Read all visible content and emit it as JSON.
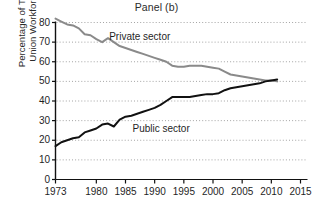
{
  "chart_data": {
    "type": "line",
    "title": "Panel (b)",
    "xlabel": "",
    "ylabel": "Percentage of Total Union Workforce",
    "ylabel_lines": [
      "Percentage of Total",
      "Union Workforce"
    ],
    "xlim": [
      1973,
      2015
    ],
    "ylim": [
      0,
      80
    ],
    "grid": true,
    "grid_axis": "y",
    "legend": "inline-annotations",
    "xticks": [
      1973,
      1980,
      1985,
      1990,
      1995,
      2000,
      2005,
      2010,
      2015
    ],
    "xtick_labels": [
      "1973",
      "1980",
      "1985",
      "1990",
      "1995",
      "2000",
      "2005",
      "2010",
      "2015"
    ],
    "yticks": [
      0,
      10,
      20,
      30,
      40,
      50,
      60,
      70,
      80
    ],
    "ytick_labels": [
      "0",
      "10",
      "20",
      "30",
      "40",
      "50",
      "60",
      "70",
      "80"
    ],
    "series": [
      {
        "name": "Private sector",
        "color": "#8a8a8a",
        "label_x": 1982.2,
        "label_y": 72.5,
        "x": [
          1973,
          1974,
          1975,
          1976,
          1977,
          1978,
          1979,
          1980,
          1981,
          1982,
          1983,
          1984,
          1985,
          1986,
          1987,
          1988,
          1989,
          1990,
          1991,
          1992,
          1993,
          1994,
          1995,
          1996,
          1997,
          1998,
          1999,
          2000,
          2001,
          2002,
          2003,
          2004,
          2005,
          2006,
          2007,
          2008,
          2009,
          2010,
          2011
        ],
        "values": [
          82,
          80.5,
          79,
          78.5,
          77,
          74,
          73.5,
          71.5,
          70,
          72,
          70,
          68,
          67,
          66,
          65,
          64,
          63,
          62,
          61,
          60,
          58,
          57.5,
          57.5,
          58,
          58,
          58,
          57.5,
          57,
          56.5,
          55,
          53.5,
          53,
          52.5,
          52,
          51.5,
          51,
          50.5,
          50.5,
          50
        ]
      },
      {
        "name": "Public sector",
        "color": "#111111",
        "label_x": 1986.2,
        "label_y": 25.5,
        "x": [
          1973,
          1974,
          1975,
          1976,
          1977,
          1978,
          1979,
          1980,
          1981,
          1982,
          1983,
          1984,
          1985,
          1986,
          1987,
          1988,
          1989,
          1990,
          1991,
          1992,
          1993,
          1994,
          1995,
          1996,
          1997,
          1998,
          1999,
          2000,
          2001,
          2002,
          2003,
          2004,
          2005,
          2006,
          2007,
          2008,
          2009,
          2010,
          2011
        ],
        "values": [
          17,
          19,
          20,
          21,
          21.5,
          24,
          25,
          26,
          28,
          28.5,
          27,
          30.5,
          32,
          32.5,
          33.5,
          34.5,
          35.5,
          36.5,
          38,
          40,
          42,
          42,
          42,
          42,
          42.5,
          43,
          43.5,
          43.5,
          44,
          45.5,
          46.5,
          47,
          47.5,
          48,
          48.5,
          49,
          50,
          50.5,
          51
        ]
      }
    ]
  }
}
